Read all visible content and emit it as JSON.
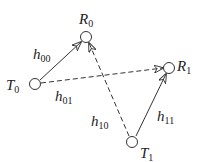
{
  "diagram": {
    "type": "channel-diagram",
    "nodes": [
      {
        "id": "T0",
        "label": "T",
        "sub": "0",
        "cx": 35,
        "cy": 84,
        "lx": 6,
        "ly": 90
      },
      {
        "id": "R0",
        "label": "R",
        "sub": "0",
        "cx": 86,
        "cy": 37,
        "lx": 79,
        "ly": 24
      },
      {
        "id": "R1",
        "label": "R",
        "sub": "1",
        "cx": 169,
        "cy": 68,
        "lx": 177,
        "ly": 71
      },
      {
        "id": "T1",
        "label": "T",
        "sub": "1",
        "cx": 132,
        "cy": 142,
        "lx": 140,
        "ly": 158
      }
    ],
    "edges": [
      {
        "from": "T0",
        "to": "R0",
        "style": "solid",
        "label": "h",
        "sub": "00",
        "lx": 33,
        "ly": 59
      },
      {
        "from": "T0",
        "to": "R1",
        "style": "dashed",
        "label": "h",
        "sub": "01",
        "lx": 55,
        "ly": 101
      },
      {
        "from": "T1",
        "to": "R0",
        "style": "dashed",
        "label": "h",
        "sub": "10",
        "lx": 91,
        "ly": 126
      },
      {
        "from": "T1",
        "to": "R1",
        "style": "solid",
        "label": "h",
        "sub": "11",
        "lx": 157,
        "ly": 121
      }
    ],
    "colors": {
      "stroke": "#333333",
      "text": "#222222",
      "background": "#ffffff"
    }
  }
}
